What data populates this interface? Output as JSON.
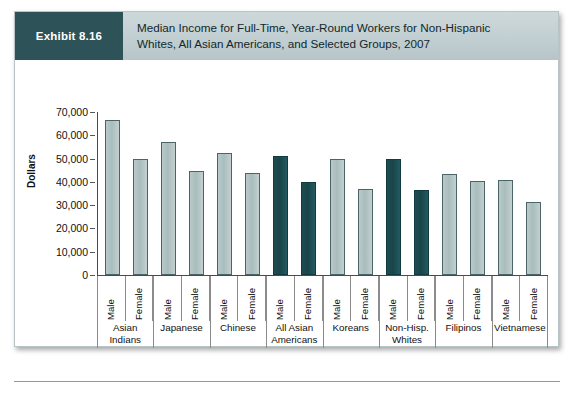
{
  "exhibit": {
    "badge_label": "Exhibit 8.16",
    "title_line1": "Median Income for Full-Time, Year-Round Workers for Non-Hispanic",
    "title_line2": "Whites, All Asian Americans, and Selected Groups, 2007"
  },
  "colors": {
    "badge_bg": "#2d5258",
    "header_band": "#c2cfd2",
    "bar_light": "#b3c5c5",
    "bar_dark": "#1f4c51",
    "axis": "#4a4a4a"
  },
  "chart_data": {
    "type": "bar",
    "title": "Median Income for Full-Time, Year-Round Workers for Non-Hispanic Whites, All Asian Americans, and Selected Groups, 2007",
    "xlabel": "",
    "ylabel": "Dollars",
    "ylim": [
      0,
      70000
    ],
    "ytick_labels": [
      "70,000",
      "60,000",
      "50,000",
      "40,000",
      "30,000",
      "20,000",
      "10,000",
      "0"
    ],
    "ytick_values": [
      70000,
      60000,
      50000,
      40000,
      30000,
      20000,
      10000,
      0
    ],
    "grid": false,
    "legend": "none",
    "gender_labels": [
      "Male",
      "Female"
    ],
    "categories": [
      "Asian Indians",
      "Japanese",
      "Chinese",
      "All Asian Americans",
      "Koreans",
      "Non-Hisp. Whites",
      "Filipinos",
      "Vietnamese"
    ],
    "series": [
      {
        "name": "Male",
        "values": [
          66500,
          57000,
          52500,
          51000,
          50000,
          50000,
          43500,
          41000
        ]
      },
      {
        "name": "Female",
        "values": [
          50000,
          44500,
          44000,
          40000,
          37000,
          36500,
          40500,
          31500
        ]
      }
    ],
    "groups": [
      {
        "label_line1": "Asian",
        "label_line2": "Indians",
        "highlight": false,
        "bars": [
          {
            "gender": "Male",
            "value": 66500
          },
          {
            "gender": "Female",
            "value": 50000
          }
        ]
      },
      {
        "label_line1": "Japanese",
        "label_line2": "",
        "highlight": false,
        "bars": [
          {
            "gender": "Male",
            "value": 57000
          },
          {
            "gender": "Female",
            "value": 44500
          }
        ]
      },
      {
        "label_line1": "Chinese",
        "label_line2": "",
        "highlight": false,
        "bars": [
          {
            "gender": "Male",
            "value": 52500
          },
          {
            "gender": "Female",
            "value": 44000
          }
        ]
      },
      {
        "label_line1": "All Asian",
        "label_line2": "Americans",
        "highlight": true,
        "bars": [
          {
            "gender": "Male",
            "value": 51000
          },
          {
            "gender": "Female",
            "value": 40000
          }
        ]
      },
      {
        "label_line1": "Koreans",
        "label_line2": "",
        "highlight": false,
        "bars": [
          {
            "gender": "Male",
            "value": 50000
          },
          {
            "gender": "Female",
            "value": 37000
          }
        ]
      },
      {
        "label_line1": "Non-Hisp.",
        "label_line2": "Whites",
        "highlight": true,
        "bars": [
          {
            "gender": "Male",
            "value": 50000
          },
          {
            "gender": "Female",
            "value": 36500
          }
        ]
      },
      {
        "label_line1": "Filipinos",
        "label_line2": "",
        "highlight": false,
        "bars": [
          {
            "gender": "Male",
            "value": 43500
          },
          {
            "gender": "Female",
            "value": 40500
          }
        ]
      },
      {
        "label_line1": "Vietnamese",
        "label_line2": "",
        "highlight": false,
        "bars": [
          {
            "gender": "Male",
            "value": 41000
          },
          {
            "gender": "Female",
            "value": 31500
          }
        ]
      }
    ]
  }
}
